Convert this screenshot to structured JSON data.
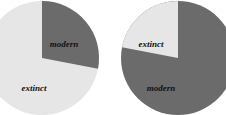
{
  "chart_data": [
    {
      "type": "pie",
      "title": "",
      "categories": [
        "modern",
        "extinct"
      ],
      "values": [
        28,
        72
      ],
      "colors": {
        "modern": "#6b6b6b",
        "extinct": "#e6e6e6"
      },
      "labels": {
        "modern": "modern",
        "extinct": "extinct"
      }
    },
    {
      "type": "pie",
      "title": "",
      "categories": [
        "modern",
        "extinct"
      ],
      "values": [
        78,
        22
      ],
      "colors": {
        "modern": "#6b6b6b",
        "extinct": "#e6e6e6"
      },
      "labels": {
        "modern": "modern",
        "extinct": "extinct"
      }
    }
  ]
}
